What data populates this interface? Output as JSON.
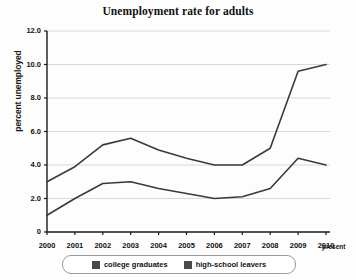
{
  "chart_data": {
    "type": "line",
    "title": "Unemployment rate for adults",
    "xlabel": "",
    "ylabel": "percent unemployed",
    "categories": [
      "2000",
      "2001",
      "2002",
      "2003",
      "2004",
      "2005",
      "2006",
      "2007",
      "2008",
      "2009",
      "2010"
    ],
    "x_extra_label": "present",
    "ylim": [
      0,
      12
    ],
    "yticks": [
      "0",
      "2.0",
      "4.0",
      "6.0",
      "8.0",
      "10.0",
      "12.0"
    ],
    "ytick_values": [
      0,
      2,
      4,
      6,
      8,
      10,
      12
    ],
    "grid": true,
    "legend_position": "bottom",
    "series": [
      {
        "name": "college graduates",
        "color": "#3a3a3a",
        "values": [
          3.0,
          3.9,
          5.2,
          5.6,
          4.9,
          4.4,
          4.0,
          4.0,
          5.0,
          9.6,
          10.0
        ]
      },
      {
        "name": "high-school leavers",
        "color": "#3a3a3a",
        "values": [
          1.0,
          2.0,
          2.9,
          3.0,
          2.6,
          2.3,
          2.0,
          2.1,
          2.6,
          4.4,
          4.0
        ]
      }
    ]
  },
  "colors": {
    "axis": "#1a1a1a",
    "grid": "#d8d8d8",
    "line": "#3a3a3a",
    "legend_swatch": "#4a4a4a",
    "background": "#fdfdfd"
  }
}
